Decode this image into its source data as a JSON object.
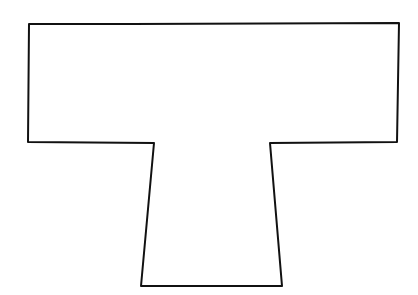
{
  "diagram": {
    "shape": "T-shape outline (hand-drawn)",
    "stroke_color": "#111111",
    "background_color": "#ffffff",
    "points": "29,24 132,24 399,23 397,142 270,143 282,286 141,286 154,143 28,142"
  }
}
